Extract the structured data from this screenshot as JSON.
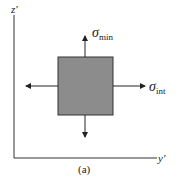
{
  "diagram": {
    "axes": {
      "vertical_label": "z'",
      "horizontal_label": "y'"
    },
    "element": {
      "fill": "#8c8c8c",
      "stroke": "#333333"
    },
    "stresses": [
      {
        "symbol": "σ",
        "subscript": "min",
        "direction": "vertical"
      },
      {
        "symbol": "σ",
        "subscript": "int",
        "direction": "horizontal"
      }
    ],
    "caption": "(a)"
  }
}
